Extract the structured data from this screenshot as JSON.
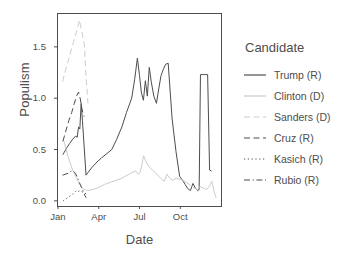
{
  "chart_data": {
    "type": "line",
    "title": "",
    "xlabel": "Date",
    "ylabel": "Populism",
    "legend_title": "Candidate",
    "legend_position": "right",
    "grid": false,
    "x_tick_labels": [
      "Jan",
      "Apr",
      "Jul",
      "Oct"
    ],
    "x_tick_positions": [
      0.0,
      0.25,
      0.5,
      0.75
    ],
    "y_tick_labels": [
      "0.0",
      "0.5",
      "1.0",
      "1.5"
    ],
    "y_tick_values": [
      0.0,
      0.5,
      1.0,
      1.5
    ],
    "ylim": [
      -0.05,
      1.82
    ],
    "xlim": [
      0.0,
      1.0
    ],
    "series": [
      {
        "name": "Trump (R)",
        "label": "Trump (R)",
        "color": "#4d4d4d",
        "dash": "none",
        "x": [
          0.03,
          0.055,
          0.072,
          0.09,
          0.107,
          0.118,
          0.126,
          0.134,
          0.142,
          0.15,
          0.172,
          0.205,
          0.24,
          0.268,
          0.3,
          0.33,
          0.36,
          0.392,
          0.42,
          0.452,
          0.47,
          0.487,
          0.5,
          0.512,
          0.524,
          0.536,
          0.548,
          0.56,
          0.572,
          0.588,
          0.604,
          0.618,
          0.632,
          0.646,
          0.66,
          0.676,
          0.7,
          0.724,
          0.746,
          0.764,
          0.78,
          0.796,
          0.812,
          0.828,
          0.844,
          0.858,
          0.866,
          0.874,
          0.884,
          0.894,
          0.906,
          0.918,
          0.93,
          0.942
        ],
        "y": [
          0.45,
          0.52,
          0.56,
          0.6,
          0.63,
          0.62,
          0.72,
          0.7,
          0.95,
          0.78,
          0.25,
          0.32,
          0.38,
          0.42,
          0.46,
          0.5,
          0.6,
          0.72,
          0.86,
          1.0,
          1.18,
          1.39,
          1.22,
          1.05,
          0.98,
          1.17,
          1.02,
          1.3,
          1.16,
          1.02,
          0.95,
          1.09,
          1.22,
          1.28,
          1.33,
          1.34,
          0.8,
          0.48,
          0.24,
          0.2,
          0.16,
          0.12,
          0.1,
          0.17,
          0.12,
          0.1,
          0.11,
          1.23,
          1.23,
          1.23,
          1.23,
          1.23,
          0.3,
          0.29
        ]
      },
      {
        "name": "Clinton (D)",
        "label": "Clinton (D)",
        "color": "#cccccc",
        "dash": "none",
        "x": [
          0.033,
          0.06,
          0.09,
          0.12,
          0.15,
          0.18,
          0.215,
          0.25,
          0.285,
          0.32,
          0.355,
          0.39,
          0.425,
          0.458,
          0.478,
          0.492,
          0.5,
          0.512,
          0.525,
          0.54,
          0.56,
          0.58,
          0.6,
          0.618,
          0.636,
          0.652,
          0.668,
          0.686,
          0.704,
          0.724,
          0.746,
          0.766,
          0.786,
          0.806,
          0.824,
          0.84,
          0.856,
          0.87,
          0.884,
          0.898,
          0.912,
          0.928,
          0.944,
          0.958,
          0.97
        ],
        "y": [
          0.6,
          0.44,
          0.3,
          0.2,
          0.12,
          0.1,
          0.11,
          0.13,
          0.16,
          0.18,
          0.2,
          0.22,
          0.25,
          0.28,
          0.29,
          0.26,
          0.27,
          0.33,
          0.44,
          0.38,
          0.33,
          0.3,
          0.27,
          0.24,
          0.21,
          0.19,
          0.26,
          0.22,
          0.2,
          0.22,
          0.21,
          0.2,
          0.18,
          0.16,
          0.14,
          0.12,
          0.11,
          0.14,
          0.13,
          0.12,
          0.11,
          0.14,
          0.19,
          0.09,
          0.03
        ]
      },
      {
        "name": "Sanders (D)",
        "label": "Sanders (D)",
        "color": "#cccccc",
        "dash": "long",
        "x": [
          0.028,
          0.045,
          0.062,
          0.078,
          0.094,
          0.11,
          0.122,
          0.132,
          0.142,
          0.152,
          0.162,
          0.172,
          0.184
        ],
        "y": [
          1.16,
          1.27,
          1.36,
          1.45,
          1.54,
          1.63,
          1.7,
          1.76,
          1.68,
          1.6,
          1.52,
          1.2,
          0.95
        ]
      },
      {
        "name": "Cruz (R)",
        "label": "Cruz (R)",
        "color": "#4d4d4d",
        "dash": "long",
        "x": [
          0.03,
          0.048,
          0.066,
          0.084,
          0.1,
          0.114,
          0.126,
          0.136,
          0.144,
          0.152,
          0.16
        ],
        "y": [
          0.58,
          0.68,
          0.78,
          0.86,
          0.95,
          1.02,
          1.06,
          1.0,
          0.92,
          0.86,
          0.82
        ]
      },
      {
        "name": "Kasich (R)",
        "label": "Kasich (R)",
        "color": "#4d4d4d",
        "dash": "dot",
        "x": [
          0.032,
          0.05,
          0.068,
          0.086,
          0.1,
          0.112,
          0.124,
          0.134,
          0.146,
          0.158,
          0.172,
          0.188
        ],
        "y": [
          0.0,
          0.02,
          0.04,
          0.06,
          0.08,
          0.1,
          0.09,
          0.1,
          0.09,
          0.08,
          0.07,
          0.06
        ]
      },
      {
        "name": "Rubio (R)",
        "label": "Rubio (R)",
        "color": "#4d4d4d",
        "dash": "dashdot",
        "x": [
          0.028,
          0.046,
          0.064,
          0.08,
          0.094,
          0.106,
          0.116,
          0.126,
          0.136,
          0.148,
          0.16,
          0.172
        ],
        "y": [
          0.25,
          0.26,
          0.27,
          0.29,
          0.29,
          0.27,
          0.24,
          0.2,
          0.16,
          0.12,
          0.07,
          0.03
        ]
      }
    ]
  }
}
